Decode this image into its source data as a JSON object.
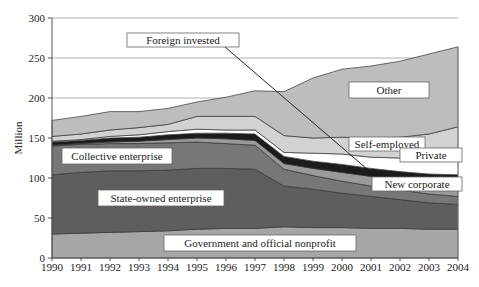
{
  "chart_data": {
    "type": "area",
    "stacked": true,
    "title": "",
    "xlabel": "",
    "ylabel": "Million",
    "ylim": [
      0,
      300
    ],
    "yticks": [
      0,
      50,
      100,
      150,
      200,
      250,
      300
    ],
    "grid": "horizontal",
    "x": [
      1990,
      1991,
      1992,
      1993,
      1994,
      1995,
      1996,
      1997,
      1998,
      1999,
      2000,
      2001,
      2002,
      2003,
      2004
    ],
    "series": [
      {
        "name": "Government and official nonprofit",
        "color": "#a6a6a6",
        "values": [
          30,
          31,
          32,
          33,
          34,
          36,
          37,
          37,
          39,
          38,
          38,
          37,
          37,
          36,
          36
        ]
      },
      {
        "name": "State-owned enterprise",
        "color": "#5e5e5e",
        "values": [
          74,
          76,
          77,
          76,
          76,
          76,
          75,
          74,
          51,
          48,
          43,
          40,
          36,
          33,
          31
        ]
      },
      {
        "name": "Collective enterprise",
        "color": "#777777",
        "values": [
          36,
          35,
          34,
          34,
          34,
          33,
          31,
          30,
          21,
          17,
          15,
          13,
          12,
          11,
          10
        ]
      },
      {
        "name": "New corporate",
        "color": "#9a9a9a",
        "values": [
          1,
          1,
          2,
          3,
          4,
          5,
          6,
          6,
          7,
          9,
          11,
          12,
          13,
          15,
          17
        ]
      },
      {
        "name": "Foreign invested",
        "color": "#1c1c1c",
        "values": [
          4,
          4,
          5,
          5,
          6,
          6,
          7,
          8,
          9,
          9,
          10,
          10,
          10,
          10,
          10
        ]
      },
      {
        "name": "Private",
        "color": "#ffffff",
        "values": [
          1,
          1,
          2,
          3,
          4,
          5,
          4,
          5,
          5,
          10,
          13,
          14,
          17,
          20,
          25
        ]
      },
      {
        "name": "Self-employed",
        "color": "#d2d2d2",
        "values": [
          6,
          7,
          8,
          9,
          9,
          16,
          17,
          17,
          21,
          19,
          21,
          24,
          26,
          30,
          35
        ]
      },
      {
        "name": "Other",
        "color": "#bdbdbd",
        "values": [
          20,
          22,
          23,
          20,
          20,
          18,
          24,
          32,
          55,
          75,
          85,
          90,
          95,
          100,
          100
        ]
      }
    ],
    "totals": [
      172,
      177,
      183,
      183,
      187,
      195,
      201,
      209,
      208,
      225,
      236,
      240,
      246,
      255,
      264
    ],
    "annotations": [
      {
        "text": "Foreign invested",
        "box": [
          127,
          33,
          112,
          14
        ],
        "line_to": [
          367,
          169
        ]
      },
      {
        "text": "Other",
        "box": [
          349,
          82,
          80,
          16
        ]
      },
      {
        "text": "Self-employed",
        "box": [
          349,
          137,
          76,
          14
        ]
      },
      {
        "text": "Private",
        "box": [
          400,
          148,
          62,
          14
        ]
      },
      {
        "text": "New corporate",
        "box": [
          372,
          177,
          90,
          14
        ]
      },
      {
        "text": "Collective enterprise",
        "box": [
          62,
          148,
          110,
          16
        ]
      },
      {
        "text": "State-owned enterprise",
        "box": [
          98,
          190,
          126,
          16
        ]
      },
      {
        "text": "Government and official nonprofit",
        "box": [
          164,
          235,
          192,
          16
        ]
      }
    ]
  }
}
